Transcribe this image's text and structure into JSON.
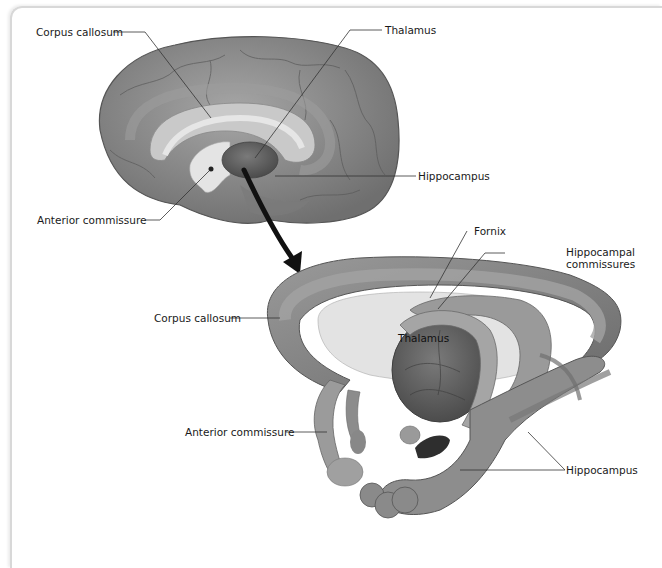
{
  "figure": {
    "top_view": {
      "description": "Midsagittal view of the human brain",
      "labels": {
        "corpus_callosum": "Corpus callosum",
        "thalamus": "Thalamus",
        "hippocampus": "Hippocampus",
        "anterior_commissure": "Anterior commissure"
      }
    },
    "bottom_view": {
      "description": "Enlarged 3D view of commissures and limbic structures",
      "labels": {
        "fornix": "Fornix",
        "hippocampal_commissures_line1": "Hippocampal",
        "hippocampal_commissures_line2": "commissures",
        "corpus_callosum": "Corpus callosum",
        "thalamus": "Thalamus",
        "anterior_commissure": "Anterior commissure",
        "hippocampus": "Hippocampus"
      }
    },
    "colors": {
      "tissue": "#8a8a8a",
      "tissue_dark": "#5e5e5e",
      "tissue_light": "#b5b5b5",
      "pale_area": "#e2e2e2",
      "arrow": "#111111",
      "leader_line": "#333333",
      "frame": "#d8d8d8"
    }
  }
}
